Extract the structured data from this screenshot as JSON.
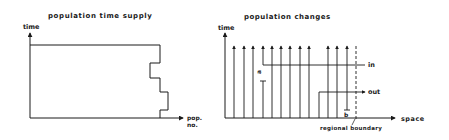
{
  "left_diagram": {
    "title": "population time supply",
    "y_axis_label": "time",
    "x_axis_label_line1": "pop.",
    "x_axis_label_line2": "no."
  },
  "right_diagram": {
    "title": "population changes",
    "y_axis_label": "time",
    "x_axis_label": "space",
    "in_label": "in",
    "out_label": "out",
    "boundary_label": "regional boundary",
    "marker_a": "a",
    "marker_b": "b"
  },
  "colors": {
    "ink": "#1a1a1a",
    "background": "#ffffff"
  }
}
